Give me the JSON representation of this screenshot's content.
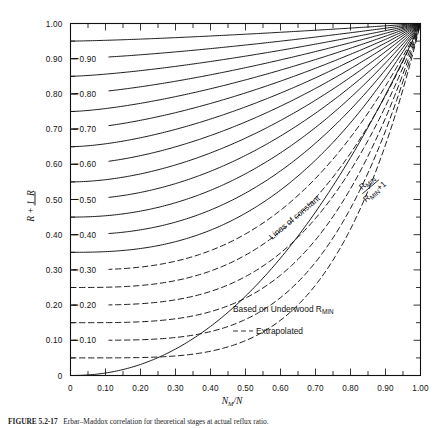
{
  "figure": {
    "caption_prefix": "FIGURE 5.2-17",
    "caption_text": "Erbar–Maddox correlation for theoretical stages at actual reflux ratio."
  },
  "chart_data": {
    "type": "line",
    "title": "",
    "xlabel": "N_M/N",
    "ylabel": "R/(R+1)",
    "xlim": [
      0,
      1
    ],
    "ylim": [
      0,
      1
    ],
    "grid": false,
    "legend_position": "inside-bottom-right",
    "x_ticks": [
      "0",
      "0.10",
      "0.20",
      "0.30",
      "0.40",
      "0.50",
      "0.60",
      "0.70",
      "0.80",
      "0.90",
      "1.00"
    ],
    "x_tick_values": [
      0,
      0.1,
      0.2,
      0.3,
      0.4,
      0.5,
      0.6,
      0.7,
      0.8,
      0.9,
      1.0
    ],
    "y_ticks": [
      "0",
      "0.10",
      "0.20",
      "0.30",
      "0.40",
      "0.50",
      "0.60",
      "0.70",
      "0.80",
      "0.90",
      "1.00"
    ],
    "y_tick_values": [
      0,
      0.1,
      0.2,
      0.3,
      0.4,
      0.5,
      0.6,
      0.7,
      0.8,
      0.9,
      1.0
    ],
    "minor_tick_step": 0.05,
    "annotation_constant": "Lines of constant",
    "annotation_ratio_num": "R_MIN",
    "annotation_ratio_den": "R_MIN + 1",
    "legend": [
      {
        "style": "solid",
        "label": "Based on Underwood R",
        "label_sub": "MIN"
      },
      {
        "style": "dashed",
        "label": "Extrapolated",
        "label_sub": ""
      }
    ],
    "curve_param_name": "R_MIN/(R_MIN+1) at left axis",
    "series": [
      {
        "name": "0.95",
        "label": "",
        "style": "solid",
        "y0": 0.95
      },
      {
        "name": "0.90",
        "label": "0.90",
        "style": "solid",
        "y0": 0.9
      },
      {
        "name": "0.85",
        "label": "",
        "style": "solid",
        "y0": 0.85
      },
      {
        "name": "0.80",
        "label": "0.80",
        "style": "solid",
        "y0": 0.8
      },
      {
        "name": "0.75",
        "label": "",
        "style": "solid",
        "y0": 0.75
      },
      {
        "name": "0.70",
        "label": "0.70",
        "style": "solid",
        "y0": 0.7
      },
      {
        "name": "0.65",
        "label": "",
        "style": "solid",
        "y0": 0.65
      },
      {
        "name": "0.60",
        "label": "0.60",
        "style": "solid",
        "y0": 0.6
      },
      {
        "name": "0.55",
        "label": "",
        "style": "solid",
        "y0": 0.55
      },
      {
        "name": "0.50",
        "label": "0.50",
        "style": "solid",
        "y0": 0.5
      },
      {
        "name": "0.45",
        "label": "",
        "style": "solid",
        "y0": 0.45
      },
      {
        "name": "0.40",
        "label": "0.40",
        "style": "solid",
        "y0": 0.4
      },
      {
        "name": "0.35",
        "label": "",
        "style": "solid",
        "y0": 0.35
      },
      {
        "name": "0.30",
        "label": "0.30",
        "style": "dashed",
        "y0": 0.3
      },
      {
        "name": "0.25",
        "label": "",
        "style": "dashed",
        "y0": 0.25
      },
      {
        "name": "0.20",
        "label": "0.20",
        "style": "dashed",
        "y0": 0.2
      },
      {
        "name": "0.15",
        "label": "",
        "style": "dashed",
        "y0": 0.15
      },
      {
        "name": "0.10",
        "label": "0.10",
        "style": "dashed",
        "y0": 0.1
      },
      {
        "name": "0.05",
        "label": "",
        "style": "dashed",
        "y0": 0.05
      },
      {
        "name": "0.00",
        "label": "",
        "style": "solid",
        "y0": 0.0
      }
    ]
  }
}
